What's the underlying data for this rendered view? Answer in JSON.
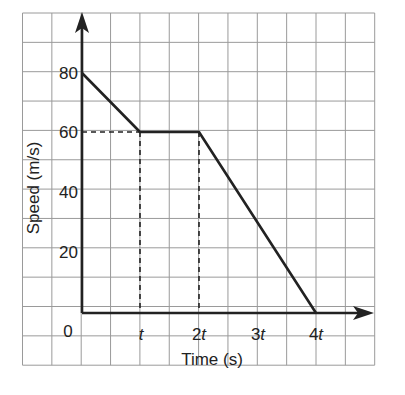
{
  "chart_data": {
    "type": "line",
    "title": "",
    "xlabel": "Time (s)",
    "ylabel": "Speed (m/s)",
    "x_ticks": [
      {
        "value": 0,
        "label": "0"
      },
      {
        "value": 1,
        "label": "t"
      },
      {
        "value": 2,
        "label": "2t"
      },
      {
        "value": 3,
        "label": "3t"
      },
      {
        "value": 4,
        "label": "4t"
      }
    ],
    "y_ticks": [
      {
        "value": 20,
        "label": "20"
      },
      {
        "value": 40,
        "label": "40"
      },
      {
        "value": 60,
        "label": "60"
      },
      {
        "value": 80,
        "label": "80"
      }
    ],
    "x_unit": "t",
    "series": [
      {
        "name": "speed",
        "points": [
          {
            "x": 0,
            "y": 80
          },
          {
            "x": 1,
            "y": 60
          },
          {
            "x": 2,
            "y": 60
          },
          {
            "x": 4,
            "y": 0
          }
        ]
      }
    ],
    "guides": [
      {
        "type": "dashed-horizontal",
        "from": {
          "x": 0,
          "y": 60
        },
        "to": {
          "x": 1,
          "y": 60
        }
      },
      {
        "type": "dashed-vertical",
        "from": {
          "x": 1,
          "y": 0
        },
        "to": {
          "x": 1,
          "y": 60
        }
      },
      {
        "type": "dashed-vertical",
        "from": {
          "x": 2,
          "y": 0
        },
        "to": {
          "x": 2,
          "y": 60
        }
      }
    ],
    "xlim": [
      0,
      4.5
    ],
    "ylim": [
      0,
      100
    ],
    "grid": true,
    "legend": null
  },
  "labels": {
    "origin": "0",
    "xlabel": "Time (s)",
    "ylabel": "Speed (m/s)",
    "x1": "t",
    "x2": "2",
    "x3": "3",
    "x4": "4",
    "t": "t",
    "y20": "20",
    "y40": "40",
    "y60": "60",
    "y80": "80"
  }
}
